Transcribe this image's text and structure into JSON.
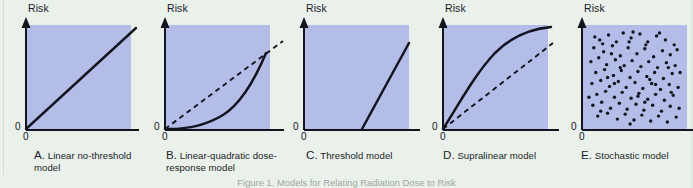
{
  "figure": {
    "background_color": "#e9f1ea",
    "plot_fill_color": "#b3bde8",
    "ink_color": "#14141f",
    "axis_y_label": "Risk",
    "origin_y_label": "0",
    "origin_x_label": "0",
    "bottom_caption": "Figure 1. Models for Relating Radiation Dose to Risk"
  },
  "chart_data": [
    {
      "id": "panel-a",
      "type": "line",
      "title": "A. Linear no-threshold model",
      "caption_letter": "A.",
      "caption_text": "Linear no-threshold model",
      "ylabel": "Risk",
      "xlabel": "",
      "xlim": [
        0,
        1
      ],
      "ylim": [
        0,
        1
      ],
      "grid": false,
      "legend": "none",
      "series": [
        {
          "name": "linear no-threshold",
          "style": "solid",
          "x": [
            0.0,
            1.0
          ],
          "y": [
            0.0,
            1.0
          ]
        }
      ]
    },
    {
      "id": "panel-b",
      "type": "line",
      "title": "B. Linear-quadratic dose-response model",
      "caption_letter": "B.",
      "caption_text": "Linear-quadratic dose-response model",
      "ylabel": "Risk",
      "xlabel": "",
      "xlim": [
        0,
        1
      ],
      "ylim": [
        0,
        1
      ],
      "grid": false,
      "legend": "none",
      "series": [
        {
          "name": "linear-quadratic response",
          "style": "solid",
          "x": [
            0.0,
            0.12,
            0.25,
            0.4,
            0.55,
            0.7,
            0.82,
            0.92,
            1.0
          ],
          "y": [
            0.0,
            0.01,
            0.03,
            0.08,
            0.17,
            0.31,
            0.46,
            0.62,
            0.78
          ]
        },
        {
          "name": "linear no-threshold reference",
          "style": "dashed",
          "x": [
            0.0,
            1.0
          ],
          "y": [
            0.0,
            1.0
          ]
        }
      ]
    },
    {
      "id": "panel-c",
      "type": "line",
      "title": "C. Threshold model",
      "caption_letter": "C.",
      "caption_text": "Threshold model",
      "ylabel": "Risk",
      "xlabel": "",
      "xlim": [
        0,
        1
      ],
      "ylim": [
        0,
        1
      ],
      "grid": false,
      "legend": "none",
      "series": [
        {
          "name": "threshold response",
          "style": "solid",
          "threshold_x": 0.56,
          "x": [
            0.0,
            0.56,
            1.0
          ],
          "y": [
            0.0,
            0.0,
            0.84
          ]
        }
      ]
    },
    {
      "id": "panel-d",
      "type": "line",
      "title": "D. Supralinear model",
      "caption_letter": "D.",
      "caption_text": "Supralinear model",
      "ylabel": "Risk",
      "xlabel": "",
      "xlim": [
        0,
        1
      ],
      "ylim": [
        0,
        1
      ],
      "grid": false,
      "legend": "none",
      "series": [
        {
          "name": "supralinear response",
          "style": "solid",
          "x": [
            0.0,
            0.08,
            0.18,
            0.3,
            0.45,
            0.6,
            0.75,
            0.88,
            1.0
          ],
          "y": [
            0.0,
            0.21,
            0.41,
            0.6,
            0.77,
            0.88,
            0.95,
            0.985,
            1.0
          ]
        },
        {
          "name": "linear no-threshold reference",
          "style": "dashed",
          "x": [
            0.0,
            1.0
          ],
          "y": [
            0.0,
            0.82
          ]
        }
      ]
    },
    {
      "id": "panel-e",
      "type": "scatter",
      "title": "E. Stochastic model",
      "caption_letter": "E.",
      "caption_text": "Stochastic model",
      "ylabel": "Risk",
      "xlabel": "",
      "xlim": [
        0,
        1
      ],
      "ylim": [
        0,
        1
      ],
      "grid": false,
      "legend": "none",
      "point_count": 104,
      "series": [
        {
          "name": "stochastic points",
          "style": "dots",
          "points": [
            [
              0.14,
              0.88
            ],
            [
              0.23,
              0.93
            ],
            [
              0.31,
              0.86
            ],
            [
              0.38,
              0.95
            ],
            [
              0.46,
              0.9
            ],
            [
              0.55,
              0.94
            ],
            [
              0.63,
              0.86
            ],
            [
              0.72,
              0.92
            ],
            [
              0.81,
              0.88
            ],
            [
              0.9,
              0.83
            ],
            [
              0.08,
              0.8
            ],
            [
              0.18,
              0.76
            ],
            [
              0.27,
              0.82
            ],
            [
              0.35,
              0.72
            ],
            [
              0.43,
              0.8
            ],
            [
              0.52,
              0.74
            ],
            [
              0.6,
              0.79
            ],
            [
              0.69,
              0.71
            ],
            [
              0.78,
              0.77
            ],
            [
              0.86,
              0.73
            ],
            [
              0.93,
              0.78
            ],
            [
              0.05,
              0.66
            ],
            [
              0.13,
              0.7
            ],
            [
              0.21,
              0.63
            ],
            [
              0.3,
              0.68
            ],
            [
              0.39,
              0.62
            ],
            [
              0.47,
              0.67
            ],
            [
              0.56,
              0.61
            ],
            [
              0.64,
              0.66
            ],
            [
              0.73,
              0.6
            ],
            [
              0.82,
              0.65
            ],
            [
              0.91,
              0.62
            ],
            [
              0.1,
              0.55
            ],
            [
              0.19,
              0.58
            ],
            [
              0.28,
              0.52
            ],
            [
              0.36,
              0.57
            ],
            [
              0.45,
              0.5
            ],
            [
              0.53,
              0.56
            ],
            [
              0.62,
              0.51
            ],
            [
              0.7,
              0.55
            ],
            [
              0.79,
              0.49
            ],
            [
              0.88,
              0.54
            ],
            [
              0.06,
              0.44
            ],
            [
              0.15,
              0.47
            ],
            [
              0.24,
              0.41
            ],
            [
              0.33,
              0.46
            ],
            [
              0.41,
              0.4
            ],
            [
              0.5,
              0.45
            ],
            [
              0.58,
              0.39
            ],
            [
              0.67,
              0.44
            ],
            [
              0.76,
              0.38
            ],
            [
              0.85,
              0.43
            ],
            [
              0.94,
              0.4
            ],
            [
              0.11,
              0.33
            ],
            [
              0.2,
              0.36
            ],
            [
              0.29,
              0.3
            ],
            [
              0.37,
              0.35
            ],
            [
              0.46,
              0.29
            ],
            [
              0.54,
              0.34
            ],
            [
              0.63,
              0.28
            ],
            [
              0.71,
              0.33
            ],
            [
              0.8,
              0.27
            ],
            [
              0.89,
              0.32
            ],
            [
              0.07,
              0.22
            ],
            [
              0.16,
              0.25
            ],
            [
              0.25,
              0.19
            ],
            [
              0.34,
              0.24
            ],
            [
              0.42,
              0.18
            ],
            [
              0.51,
              0.23
            ],
            [
              0.59,
              0.17
            ],
            [
              0.68,
              0.22
            ],
            [
              0.77,
              0.16
            ],
            [
              0.86,
              0.21
            ],
            [
              0.95,
              0.19
            ],
            [
              0.12,
              0.11
            ],
            [
              0.22,
              0.14
            ],
            [
              0.32,
              0.08
            ],
            [
              0.4,
              0.13
            ],
            [
              0.49,
              0.07
            ],
            [
              0.57,
              0.12
            ],
            [
              0.66,
              0.06
            ],
            [
              0.74,
              0.11
            ],
            [
              0.83,
              0.05
            ],
            [
              0.92,
              0.1
            ],
            [
              0.17,
              0.84
            ],
            [
              0.26,
              0.74
            ],
            [
              0.44,
              0.86
            ],
            [
              0.61,
              0.83
            ],
            [
              0.75,
              0.95
            ],
            [
              0.09,
              0.91
            ],
            [
              0.48,
              0.96
            ],
            [
              0.35,
              0.6
            ],
            [
              0.65,
              0.48
            ],
            [
              0.84,
              0.6
            ],
            [
              0.29,
              0.44
            ],
            [
              0.53,
              0.31
            ],
            [
              0.71,
              0.43
            ],
            [
              0.15,
              0.16
            ],
            [
              0.45,
              0.03
            ],
            [
              0.6,
              0.25
            ],
            [
              0.87,
              0.35
            ],
            [
              0.22,
              0.5
            ],
            [
              0.96,
              0.55
            ],
            [
              0.03,
              0.3
            ]
          ]
        }
      ]
    }
  ]
}
